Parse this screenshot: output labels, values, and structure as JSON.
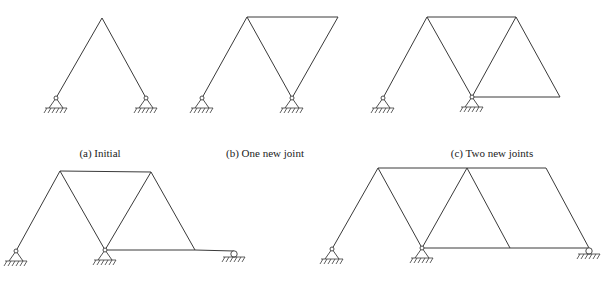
{
  "figure": {
    "panels": [
      {
        "id": "a",
        "caption": "(a)  Initial",
        "caption_pos": [
          100,
          147
        ],
        "nodes": {
          "A": [
            102,
            18
          ],
          "L": [
            56,
            98
          ],
          "R": [
            146,
            98
          ]
        },
        "members": [
          [
            "L",
            "A"
          ],
          [
            "A",
            "R"
          ]
        ],
        "pins": [
          "L",
          "R"
        ],
        "rollers": []
      },
      {
        "id": "b",
        "caption": "(b)  One new joint",
        "caption_pos": [
          265,
          147
        ],
        "nodes": {
          "A": [
            247,
            17
          ],
          "B": [
            338,
            17
          ],
          "L": [
            202,
            98
          ],
          "M": [
            292,
            98
          ]
        },
        "members": [
          [
            "L",
            "A"
          ],
          [
            "A",
            "M"
          ],
          [
            "A",
            "B"
          ],
          [
            "B",
            "M"
          ]
        ],
        "pins": [
          "L",
          "M"
        ],
        "rollers": []
      },
      {
        "id": "c",
        "caption": "(c)  Two new joints",
        "caption_pos": [
          492,
          147
        ],
        "nodes": {
          "A": [
            427,
            17
          ],
          "B": [
            516,
            17
          ],
          "L": [
            383,
            98
          ],
          "M": [
            472,
            97
          ],
          "C": [
            560,
            97
          ]
        },
        "members": [
          [
            "L",
            "A"
          ],
          [
            "A",
            "M"
          ],
          [
            "A",
            "B"
          ],
          [
            "B",
            "M"
          ],
          [
            "B",
            "C"
          ],
          [
            "M",
            "C"
          ]
        ],
        "pins": [
          "L",
          "M"
        ],
        "rollers": []
      },
      {
        "id": "d",
        "caption": "",
        "caption_pos": [
          0,
          0
        ],
        "nodes": {
          "A": [
            60,
            171
          ],
          "B": [
            151,
            172
          ],
          "L": [
            16,
            251
          ],
          "M": [
            105,
            250
          ],
          "C": [
            195,
            250
          ],
          "D": [
            234,
            251
          ]
        },
        "members": [
          [
            "L",
            "A"
          ],
          [
            "A",
            "M"
          ],
          [
            "A",
            "B"
          ],
          [
            "B",
            "M"
          ],
          [
            "B",
            "C"
          ],
          [
            "M",
            "C"
          ],
          [
            "C",
            "D"
          ]
        ],
        "pins": [
          "L",
          "M"
        ],
        "rollers": [
          "D"
        ]
      },
      {
        "id": "e",
        "caption": "",
        "caption_pos": [
          0,
          0
        ],
        "nodes": {
          "A": [
            378,
            168
          ],
          "B": [
            467,
            168
          ],
          "E": [
            546,
            168
          ],
          "L": [
            332,
            249
          ],
          "M": [
            422,
            248
          ],
          "C": [
            510,
            248
          ],
          "D": [
            589,
            248
          ]
        },
        "members": [
          [
            "L",
            "A"
          ],
          [
            "A",
            "M"
          ],
          [
            "A",
            "B"
          ],
          [
            "B",
            "M"
          ],
          [
            "B",
            "C"
          ],
          [
            "M",
            "C"
          ],
          [
            "B",
            "E"
          ],
          [
            "C",
            "D"
          ],
          [
            "E",
            "D"
          ]
        ],
        "pins": [
          "L",
          "M"
        ],
        "rollers": [
          "D"
        ]
      }
    ]
  }
}
